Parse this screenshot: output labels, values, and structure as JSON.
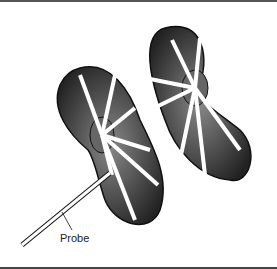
{
  "figure": {
    "labels": {
      "probe": "Probe"
    },
    "colors": {
      "line": "#111111",
      "shade": "#333333",
      "background": "#ffffff"
    }
  }
}
